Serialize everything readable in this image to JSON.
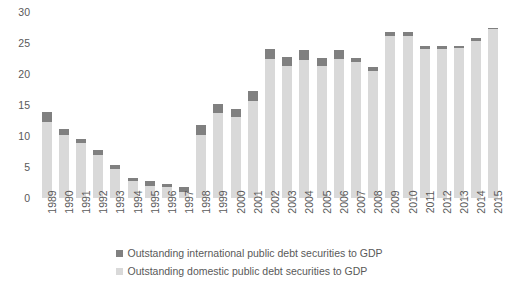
{
  "chart_data": {
    "type": "bar",
    "stacked": true,
    "title": "",
    "subtitle": "",
    "xlabel": "",
    "ylabel": "",
    "ylim": [
      0,
      30
    ],
    "yticks": [
      0,
      5,
      10,
      15,
      20,
      25,
      30
    ],
    "grid": false,
    "legend_position": "bottom",
    "categories": [
      "1989",
      "1990",
      "1991",
      "1992",
      "1993",
      "1994",
      "1995",
      "1996",
      "1997",
      "1998",
      "1999",
      "2000",
      "2001",
      "2002",
      "2003",
      "2004",
      "2005",
      "2006",
      "2007",
      "2008",
      "2009",
      "2010",
      "2011",
      "2012",
      "2013",
      "2014",
      "2015"
    ],
    "series": [
      {
        "name": "Outstanding international public debt securities to GDP",
        "color": "#808080",
        "values": [
          1.6,
          0.9,
          0.7,
          0.8,
          0.6,
          0.5,
          0.7,
          0.6,
          0.7,
          1.6,
          1.4,
          1.3,
          1.7,
          1.6,
          1.4,
          1.6,
          1.3,
          1.5,
          0.6,
          0.7,
          0.6,
          0.6,
          0.4,
          0.5,
          0.4,
          0.4,
          0.3
        ]
      },
      {
        "name": "Outstanding domestic public debt securities to GDP",
        "color": "#d9d9d9",
        "values": [
          12.3,
          10.2,
          8.8,
          6.9,
          4.7,
          2.8,
          2.0,
          1.7,
          1.0,
          10.2,
          13.7,
          13.0,
          15.6,
          22.4,
          21.3,
          22.2,
          21.3,
          22.4,
          22.0,
          20.5,
          26.1,
          26.1,
          24.1,
          24.1,
          24.2,
          25.4,
          27.2
        ]
      }
    ],
    "totals": [
      13.9,
      11.1,
      9.5,
      7.7,
      5.3,
      3.3,
      2.7,
      2.3,
      1.7,
      11.8,
      15.1,
      14.3,
      17.3,
      24.0,
      22.7,
      23.8,
      22.6,
      23.9,
      22.6,
      21.2,
      26.7,
      26.7,
      24.5,
      24.6,
      24.6,
      25.8,
      27.5
    ]
  },
  "legend": {
    "items": [
      {
        "label": "Outstanding international public debt securities to GDP",
        "color": "#808080"
      },
      {
        "label": "Outstanding domestic public debt securities to GDP",
        "color": "#d9d9d9"
      }
    ]
  }
}
